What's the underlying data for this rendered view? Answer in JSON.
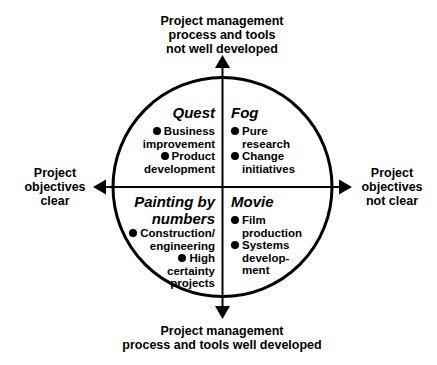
{
  "axes": {
    "top": [
      "Project management",
      "process and tools",
      "not well developed"
    ],
    "bottom": [
      "Project management",
      "process and tools well developed"
    ],
    "left": [
      "Project",
      "objectives",
      "clear"
    ],
    "right": [
      "Project",
      "objectives",
      "not clear"
    ]
  },
  "quadrants": {
    "top_left": {
      "title": "Quest",
      "items": [
        [
          "Business",
          "improvement"
        ],
        [
          "Product",
          "development"
        ]
      ]
    },
    "top_right": {
      "title": "Fog",
      "items": [
        [
          "Pure",
          "research"
        ],
        [
          "Change",
          "initiatives"
        ]
      ]
    },
    "bottom_left": {
      "title_lines": [
        "Painting by",
        "numbers"
      ],
      "items": [
        [
          "Construction/",
          "engineering"
        ],
        [
          "High",
          "certainty",
          "projects"
        ]
      ]
    },
    "bottom_right": {
      "title": "Movie",
      "items": [
        [
          "Film",
          "production"
        ],
        [
          "Systems",
          "develop-",
          "ment"
        ]
      ]
    }
  },
  "colors": {
    "ink": "#000000",
    "background": "#ffffff"
  }
}
